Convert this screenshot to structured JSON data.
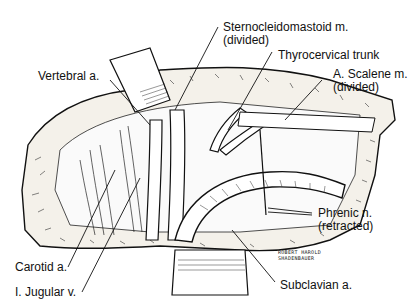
{
  "figure": {
    "type": "surgical anatomical illustration",
    "ink_color": "#111111",
    "background": "#ffffff"
  },
  "labels": {
    "sternocleidomastoid_line1": "Sternocleidomastoid m.",
    "sternocleidomastoid_line2": "(divided)",
    "thyrocervical": "Thyrocervical trunk",
    "scalene_line1": "A. Scalene m.",
    "scalene_line2": "(divided)",
    "vertebral": "Vertebral a.",
    "phrenic_line1": "Phrenic n.",
    "phrenic_line2": "(retracted)",
    "carotid": "Carotid a.",
    "jugular": "I. Jugular v.",
    "subclavian": "Subclavian a."
  },
  "signature": {
    "line1": "ROBERT HAROLD",
    "line2": "SHADENBAUER"
  }
}
